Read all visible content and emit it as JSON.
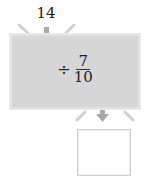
{
  "input": {
    "value": "14"
  },
  "machine": {
    "operator": "÷",
    "fraction": {
      "numerator": "7",
      "denominator": "10"
    },
    "fill_color": "#d6d6d6"
  },
  "output": {
    "value": ""
  },
  "icons": {
    "input_arrow": "down-arrow-icon",
    "output_arrow": "down-arrow-icon",
    "funnel_strokes": "funnel-line-icon"
  }
}
